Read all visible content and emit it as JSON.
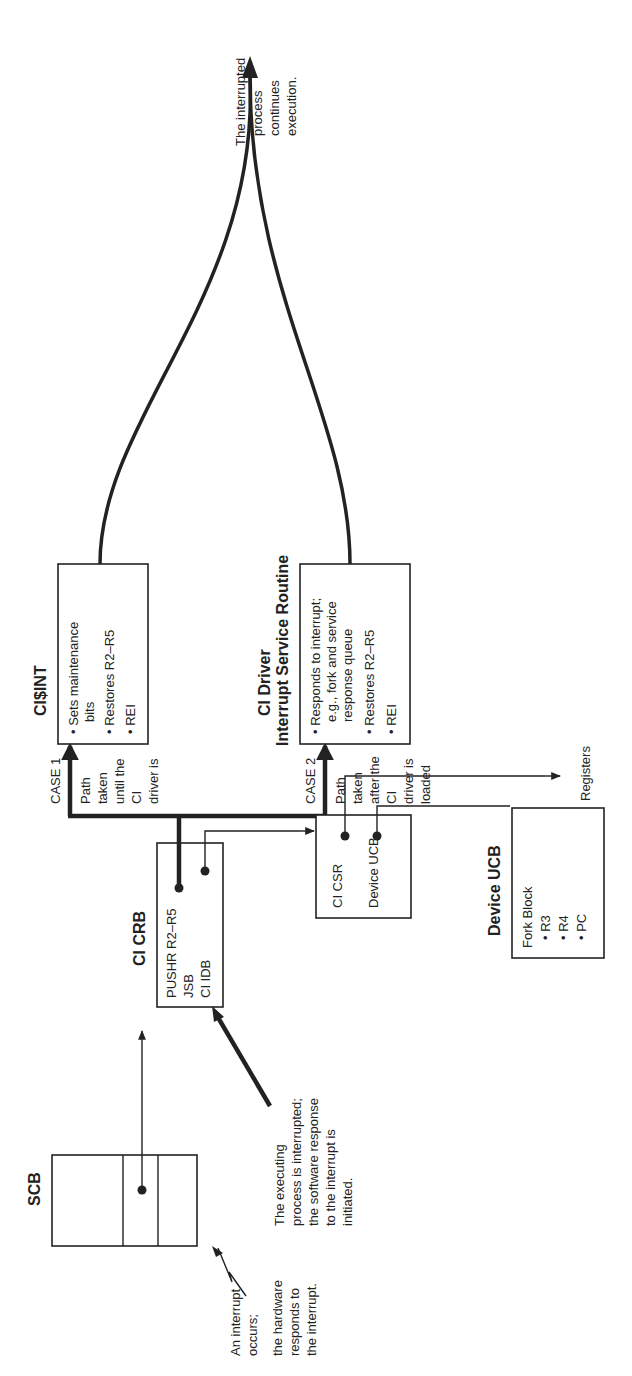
{
  "diagram": {
    "orientation": "rotated 90 degrees counter-clockwise",
    "blocks": {
      "scb": {
        "title": "SCB"
      },
      "ci_crb": {
        "title": "CI CRB",
        "lines": [
          "PUSHR R2–R5",
          "JSB",
          "CI IDB"
        ]
      },
      "ci_idb": {
        "title": "CI IDB",
        "lines": [
          "CI CSR",
          "Device UCB"
        ]
      },
      "device_ucb": {
        "title": "Device UCB",
        "lines": [
          "Fork Block",
          "• R3",
          "• R4",
          "• PC"
        ]
      },
      "ci_int": {
        "title": "CI$INT",
        "bullets": [
          "• Sets maintenance",
          "bits",
          "• Restores R2–R5",
          "• REI"
        ]
      },
      "ci_driver": {
        "title_line1": "CI Driver",
        "title_line2": "Interrupt Service Routine",
        "bullets": [
          "• Responds to interrupt;",
          "e.g., fork and service",
          "response queue",
          "• Restores R2–R5",
          "• REI"
        ]
      }
    },
    "labels": {
      "case1": "CASE 1",
      "case1_note": [
        "Path",
        "taken",
        "until the",
        "CI",
        "driver is",
        "loaded"
      ],
      "case2": "CASE 2",
      "case2_note": [
        "Path",
        "taken",
        "after the",
        "CI",
        "driver is",
        "loaded"
      ],
      "registers": "Registers",
      "interrupt_occurs": [
        "An interrupt",
        "occurs;"
      ],
      "hardware_responds": [
        "the hardware",
        "responds to",
        "the interrupt."
      ],
      "process_interrupted": [
        "The executing",
        "process is interrupted;",
        "the software response",
        "to the interrupt is",
        "initiated."
      ],
      "process_continues": [
        "The interrupted",
        "process",
        "continues",
        "execution."
      ]
    }
  }
}
